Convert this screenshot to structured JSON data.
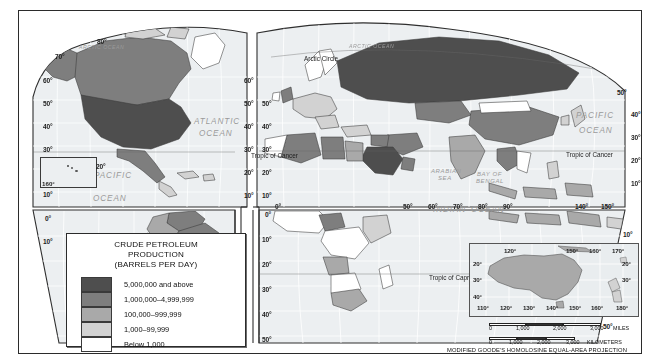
{
  "map": {
    "legend": {
      "title_line1": "CRUDE PETROLEUM",
      "title_line2": "PRODUCTION",
      "title_line3": "(BARRELS PER DAY)",
      "classes": [
        {
          "label": "5,000,000 and above",
          "color": "#4e4e4e"
        },
        {
          "label": "1,000,000–4,999,999",
          "color": "#7e7e7e"
        },
        {
          "label": "100,000–999,999",
          "color": "#a9a9a9"
        },
        {
          "label": "1,000–99,999",
          "color": "#d2d2d2"
        },
        {
          "label": "Below 1,000",
          "color": "#ffffff"
        }
      ]
    },
    "projection_note": "MODIFIED GOODE'S HOMOLOSINE EQUAL-AREA PROJECTION",
    "scale_miles": {
      "ticks": [
        "0",
        "1,000",
        "2,000",
        "3,000"
      ],
      "unit": "MILES"
    },
    "scale_km": {
      "ticks": [
        "0",
        "1,000",
        "2,000",
        "3,000"
      ],
      "unit": "KILOMETERS"
    },
    "ocean_labels": [
      {
        "text": "ARCTIC OCEAN",
        "x": 60,
        "y": 33,
        "size": "xs"
      },
      {
        "text": "ARCTIC OCEAN",
        "x": 330,
        "y": 32,
        "size": "xs"
      },
      {
        "text": "ATLANTIC",
        "x": 175,
        "y": 106,
        "size": "n"
      },
      {
        "text": "OCEAN",
        "x": 180,
        "y": 118,
        "size": "n"
      },
      {
        "text": "PACIFIC",
        "x": 75,
        "y": 160,
        "size": "n"
      },
      {
        "text": "OCEAN",
        "x": 74,
        "y": 183,
        "size": "n"
      },
      {
        "text": "PACIFIC",
        "x": 557,
        "y": 100,
        "size": "n"
      },
      {
        "text": "OCEAN",
        "x": 560,
        "y": 115,
        "size": "n"
      },
      {
        "text": "INDIAN",
        "x": 414,
        "y": 194,
        "size": "n"
      },
      {
        "text": "OCEAN",
        "x": 452,
        "y": 194,
        "size": "n"
      },
      {
        "text": "ARABIAN",
        "x": 412,
        "y": 157,
        "size": "sm"
      },
      {
        "text": "SEA",
        "x": 419,
        "y": 164,
        "size": "sm"
      },
      {
        "text": "BAY OF",
        "x": 458,
        "y": 160,
        "size": "sm"
      },
      {
        "text": "BENGAL",
        "x": 457,
        "y": 167,
        "size": "sm"
      },
      {
        "text": "CORAL  SEA",
        "x": 556,
        "y": 243,
        "size": "xs"
      }
    ],
    "line_labels": [
      {
        "text": "Arctic Circle",
        "x": 285,
        "y": 44
      },
      {
        "text": "Tropic of Cancer",
        "x": 232,
        "y": 141
      },
      {
        "text": "Tropic of Cancer",
        "x": 547,
        "y": 140
      },
      {
        "text": "Tropic of Capricorn",
        "x": 410,
        "y": 263
      }
    ],
    "left_hemisphere": {
      "lat_west": [
        {
          "t": "70°",
          "x": 36,
          "y": 42
        },
        {
          "t": "60°",
          "x": 24,
          "y": 66
        },
        {
          "t": "50°",
          "x": 24,
          "y": 89
        },
        {
          "t": "40°",
          "x": 24,
          "y": 112
        },
        {
          "t": "30°",
          "x": 24,
          "y": 135
        },
        {
          "t": "20°",
          "x": 63,
          "y": 156
        },
        {
          "t": "10°",
          "x": 24,
          "y": 180
        },
        {
          "t": "0°",
          "x": 26,
          "y": 204
        },
        {
          "t": "10°",
          "x": 24,
          "y": 227
        }
      ],
      "lat_top": [
        {
          "t": "80°",
          "x": 78,
          "y": 27
        }
      ],
      "lat_east": [
        {
          "t": "60°",
          "x": 225,
          "y": 66
        },
        {
          "t": "50°",
          "x": 225,
          "y": 89
        },
        {
          "t": "40°",
          "x": 225,
          "y": 112
        },
        {
          "t": "30°",
          "x": 225,
          "y": 135
        },
        {
          "t": "20°",
          "x": 225,
          "y": 158
        },
        {
          "t": "10°",
          "x": 225,
          "y": 181
        }
      ],
      "lat_south": [
        {
          "t": "10°",
          "x": 213,
          "y": 225
        },
        {
          "t": "20°",
          "x": 213,
          "y": 250
        },
        {
          "t": "30°",
          "x": 213,
          "y": 275
        },
        {
          "t": "40°",
          "x": 213,
          "y": 300
        },
        {
          "t": "50°",
          "x": 213,
          "y": 325
        }
      ]
    },
    "right_hemisphere": {
      "lat_west": [
        {
          "t": "50°",
          "x": 243,
          "y": 89
        },
        {
          "t": "40°",
          "x": 243,
          "y": 112
        },
        {
          "t": "30°",
          "x": 243,
          "y": 135
        },
        {
          "t": "20°",
          "x": 243,
          "y": 158
        },
        {
          "t": "10°",
          "x": 243,
          "y": 181
        }
      ],
      "lat_south": [
        {
          "t": "0°",
          "x": 246,
          "y": 200
        },
        {
          "t": "10°",
          "x": 243,
          "y": 225
        },
        {
          "t": "20°",
          "x": 243,
          "y": 250
        },
        {
          "t": "30°",
          "x": 243,
          "y": 275
        },
        {
          "t": "40°",
          "x": 243,
          "y": 300
        },
        {
          "t": "50°",
          "x": 243,
          "y": 325
        }
      ],
      "lat_east": [
        {
          "t": "50°",
          "x": 598,
          "y": 78
        },
        {
          "t": "40°",
          "x": 612,
          "y": 100
        },
        {
          "t": "30°",
          "x": 612,
          "y": 123
        },
        {
          "t": "20°",
          "x": 612,
          "y": 146
        },
        {
          "t": "10°",
          "x": 612,
          "y": 169
        },
        {
          "t": "10°",
          "x": 604,
          "y": 220
        },
        {
          "t": "40°",
          "x": 598,
          "y": 287
        },
        {
          "t": "50°",
          "x": 584,
          "y": 312
        }
      ],
      "lon_bottom": [
        {
          "t": "0°",
          "x": 256,
          "y": 192
        },
        {
          "t": "50°",
          "x": 384,
          "y": 192
        },
        {
          "t": "60°",
          "x": 409,
          "y": 192
        },
        {
          "t": "70°",
          "x": 434,
          "y": 192
        },
        {
          "t": "80°",
          "x": 459,
          "y": 192
        },
        {
          "t": "90°",
          "x": 484,
          "y": 192
        },
        {
          "t": "140°",
          "x": 556,
          "y": 192
        },
        {
          "t": "150°",
          "x": 582,
          "y": 192
        }
      ]
    },
    "hawaii_inset": {
      "lon": "160°",
      "lat_right": "20°"
    },
    "australia_inset": {
      "lon_top": [
        {
          "t": "120°",
          "x": 34,
          "y": 3
        },
        {
          "t": "150°",
          "x": 96,
          "y": 3
        },
        {
          "t": "160°",
          "x": 119,
          "y": 3
        },
        {
          "t": "170°",
          "x": 142,
          "y": 3
        }
      ],
      "lon_bottom": [
        {
          "t": "110°",
          "x": 7,
          "y": 60
        },
        {
          "t": "120°",
          "x": 30,
          "y": 60
        },
        {
          "t": "130°",
          "x": 53,
          "y": 60
        },
        {
          "t": "140°",
          "x": 76,
          "y": 60
        },
        {
          "t": "150°",
          "x": 99,
          "y": 60
        },
        {
          "t": "160°",
          "x": 121,
          "y": 60
        },
        {
          "t": "180°",
          "x": 146,
          "y": 60
        }
      ],
      "lat_left": [
        {
          "t": "20°",
          "x": 3,
          "y": 16
        },
        {
          "t": "30°",
          "x": 3,
          "y": 32
        },
        {
          "t": "40°",
          "x": 3,
          "y": 49
        }
      ],
      "lat_right": [
        {
          "t": "20°",
          "x": 152,
          "y": 16
        },
        {
          "t": "30°",
          "x": 152,
          "y": 32
        }
      ]
    }
  },
  "chart_data": {
    "type": "map",
    "title": "CRUDE PETROLEUM PRODUCTION (BARRELS PER DAY)",
    "projection": "MODIFIED GOODE'S HOMOLOSINE EQUAL-AREA PROJECTION",
    "classes": [
      "5,000,000 and above",
      "1,000,000–4,999,999",
      "100,000–999,999",
      "1,000–99,999",
      "Below 1,000"
    ],
    "class_colors": [
      "#4e4e4e",
      "#7e7e7e",
      "#a9a9a9",
      "#d2d2d2",
      "#ffffff"
    ],
    "regions": [
      {
        "name": "United States",
        "class": "5,000,000 and above"
      },
      {
        "name": "Russia",
        "class": "5,000,000 and above"
      },
      {
        "name": "Saudi Arabia",
        "class": "5,000,000 and above"
      },
      {
        "name": "Canada",
        "class": "1,000,000–4,999,999"
      },
      {
        "name": "Mexico",
        "class": "1,000,000–4,999,999"
      },
      {
        "name": "Venezuela",
        "class": "1,000,000–4,999,999"
      },
      {
        "name": "Brazil",
        "class": "1,000,000–4,999,999"
      },
      {
        "name": "Iran",
        "class": "1,000,000–4,999,999"
      },
      {
        "name": "Iraq",
        "class": "1,000,000–4,999,999"
      },
      {
        "name": "Kuwait",
        "class": "1,000,000–4,999,999"
      },
      {
        "name": "United Arab Emirates",
        "class": "1,000,000–4,999,999"
      },
      {
        "name": "Nigeria",
        "class": "1,000,000–4,999,999"
      },
      {
        "name": "Algeria",
        "class": "1,000,000–4,999,999"
      },
      {
        "name": "Libya",
        "class": "1,000,000–4,999,999"
      },
      {
        "name": "China",
        "class": "1,000,000–4,999,999"
      },
      {
        "name": "Norway",
        "class": "1,000,000–4,999,999"
      },
      {
        "name": "United Kingdom",
        "class": "1,000,000–4,999,999"
      },
      {
        "name": "Kazakhstan",
        "class": "1,000,000–4,999,999"
      },
      {
        "name": "Indonesia",
        "class": "100,000–999,999"
      },
      {
        "name": "India",
        "class": "100,000–999,999"
      },
      {
        "name": "Argentina",
        "class": "100,000–999,999"
      },
      {
        "name": "Colombia",
        "class": "100,000–999,999"
      },
      {
        "name": "Egypt",
        "class": "100,000–999,999"
      },
      {
        "name": "Angola",
        "class": "100,000–999,999"
      },
      {
        "name": "Australia",
        "class": "100,000–999,999"
      },
      {
        "name": "Malaysia",
        "class": "100,000–999,999"
      },
      {
        "name": "Oman",
        "class": "100,000–999,999"
      },
      {
        "name": "Ecuador",
        "class": "100,000–999,999"
      },
      {
        "name": "Denmark",
        "class": "1,000–99,999"
      },
      {
        "name": "Italy",
        "class": "1,000–99,999"
      },
      {
        "name": "Germany",
        "class": "1,000–99,999"
      },
      {
        "name": "Peru",
        "class": "1,000–99,999"
      },
      {
        "name": "Chile",
        "class": "1,000–99,999"
      },
      {
        "name": "Turkey",
        "class": "1,000–99,999"
      },
      {
        "name": "Greenland",
        "class": "Below 1,000"
      },
      {
        "name": "Sweden",
        "class": "Below 1,000"
      },
      {
        "name": "Finland",
        "class": "Below 1,000"
      },
      {
        "name": "South Africa",
        "class": "100,000–999,999"
      },
      {
        "name": "Japan",
        "class": "1,000–99,999"
      },
      {
        "name": "New Zealand",
        "class": "1,000–99,999"
      }
    ]
  }
}
